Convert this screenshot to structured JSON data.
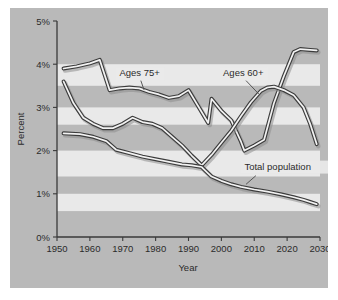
{
  "figure": {
    "panel_color": "#b9b9b9",
    "page_color": "#ffffff",
    "band_color": "#e9e9e9",
    "axis_color": "#3a3a3a",
    "line_color": "#3c3c3c",
    "line_fill": "#f2f2f2"
  },
  "chart_data": {
    "type": "line",
    "title": "",
    "xlabel": "Year",
    "ylabel": "Percent",
    "xlim": [
      1950,
      2030
    ],
    "ylim": [
      0,
      5
    ],
    "xticks": [
      1950,
      1960,
      1970,
      1980,
      1990,
      2000,
      2010,
      2020,
      2030
    ],
    "xtick_labels": [
      "1950",
      "1960",
      "1970",
      "1980",
      "1990",
      "2000",
      "2010",
      "2020",
      "2030"
    ],
    "yticks": [
      0,
      1,
      2,
      3,
      4,
      5
    ],
    "ytick_labels": [
      "0%",
      "1%",
      "2%",
      "3%",
      "4%",
      "5%"
    ],
    "grid": false,
    "legend_position": "inline-annotations",
    "bands": [
      {
        "from": 4.0,
        "to": 3.5
      },
      {
        "from": 3.0,
        "to": 2.6
      },
      {
        "from": 2.0,
        "to": 1.4
      },
      {
        "from": 1.0,
        "to": 0.6
      }
    ],
    "series": [
      {
        "name": "Ages 75+",
        "label": "Ages 75+",
        "label_x": 1969,
        "label_y": 3.72,
        "leader": [
          [
            1975.5,
            3.62
          ],
          [
            1976.5,
            3.4
          ]
        ],
        "x": [
          1952,
          1956,
          1960,
          1963,
          1966,
          1969,
          1972,
          1975,
          1978,
          1981,
          1984,
          1987,
          1990,
          1993,
          1996,
          1997,
          2000,
          2003,
          2006,
          2007,
          2010,
          2013,
          2016,
          2019,
          2022,
          2024,
          2027,
          2029
        ],
        "y": [
          3.9,
          3.95,
          4.02,
          4.1,
          3.4,
          3.44,
          3.46,
          3.44,
          3.36,
          3.3,
          3.22,
          3.26,
          3.4,
          3.02,
          2.64,
          3.2,
          2.92,
          2.7,
          2.2,
          2.0,
          2.12,
          2.25,
          3.1,
          3.72,
          4.28,
          4.35,
          4.33,
          4.32
        ]
      },
      {
        "name": "Ages 60+",
        "label": "Ages 60+",
        "label_x": 2000.5,
        "label_y": 3.72,
        "leader": [
          [
            2007.5,
            3.62
          ],
          [
            2011.5,
            3.3
          ]
        ],
        "x": [
          1952,
          1955,
          1958,
          1961,
          1964,
          1967,
          1970,
          1973,
          1976,
          1979,
          1982,
          1985,
          1988,
          1991,
          1994,
          1997,
          2000,
          2003,
          2006,
          2009,
          2012,
          2014,
          2016,
          2019,
          2022,
          2025,
          2027,
          2029
        ],
        "y": [
          3.6,
          3.1,
          2.76,
          2.62,
          2.52,
          2.52,
          2.62,
          2.76,
          2.66,
          2.62,
          2.52,
          2.32,
          2.12,
          1.88,
          1.66,
          1.9,
          2.18,
          2.46,
          2.8,
          3.12,
          3.38,
          3.46,
          3.48,
          3.4,
          3.28,
          3.0,
          2.62,
          2.15
        ]
      },
      {
        "name": "Total population",
        "label": "Total population",
        "label_x": 2007,
        "label_y": 1.56,
        "leader": [
          [
            2010.5,
            1.42
          ],
          [
            2007.5,
            1.22
          ]
        ],
        "x": [
          1952,
          1957,
          1961,
          1965,
          1968,
          1972,
          1976,
          1980,
          1984,
          1988,
          1991,
          1994,
          1997,
          2000,
          2003,
          2006,
          2010,
          2014,
          2018,
          2022,
          2025,
          2027,
          2029
        ],
        "y": [
          2.4,
          2.38,
          2.32,
          2.22,
          2.02,
          1.94,
          1.86,
          1.8,
          1.74,
          1.68,
          1.66,
          1.62,
          1.4,
          1.3,
          1.22,
          1.16,
          1.1,
          1.05,
          0.99,
          0.92,
          0.86,
          0.81,
          0.76
        ]
      }
    ]
  }
}
